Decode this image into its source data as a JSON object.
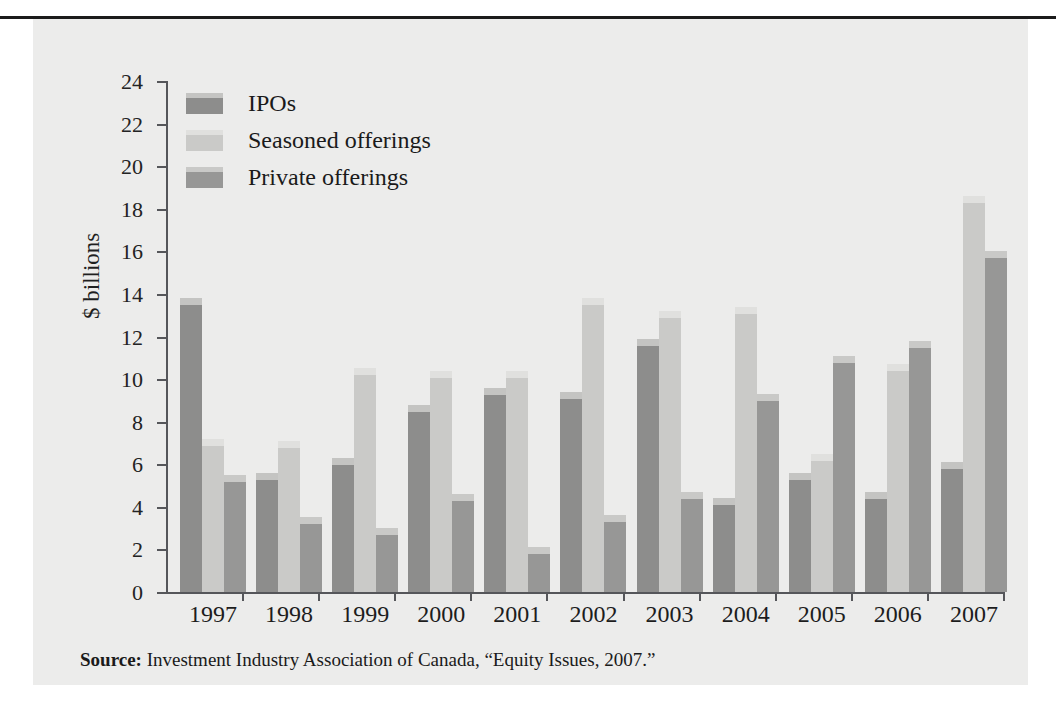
{
  "figure": {
    "y_axis_title": "$ billions",
    "source_prefix": "Source:",
    "source_text": " Investment Industry Association of Canada, “Equity Issues, 2007.”"
  },
  "colors": {
    "panel_background": "#ececeb",
    "axis": "#55565a",
    "top_rule": "#1b1b1b",
    "ipos": "#8d8d8c",
    "ipos_cap": "#c4c4c2",
    "seasoned": "#cacac8",
    "seasoned_cap": "#e0e0de",
    "private": "#979796",
    "private_cap": "#c9c9c7"
  },
  "chart_data": {
    "type": "bar",
    "title": "",
    "xlabel": "",
    "ylabel": "$ billions",
    "ylim": [
      0,
      24
    ],
    "yticks": [
      0,
      2,
      4,
      6,
      8,
      10,
      12,
      14,
      16,
      18,
      20,
      22,
      24
    ],
    "ytick_labels": [
      "0",
      "2",
      "4",
      "6",
      "8",
      "10",
      "12",
      "14",
      "16",
      "18",
      "20",
      "22",
      "24"
    ],
    "grid": false,
    "legend_position": "upper-left",
    "categories": [
      "1997",
      "1998",
      "1999",
      "2000",
      "2001",
      "2002",
      "2003",
      "2004",
      "2005",
      "2006",
      "2007"
    ],
    "series": [
      {
        "name": "IPOs",
        "color": "#8d8d8c",
        "values": [
          13.8,
          5.6,
          6.3,
          8.8,
          9.6,
          9.4,
          11.9,
          4.4,
          5.6,
          4.7,
          6.1
        ]
      },
      {
        "name": "Seasoned offerings",
        "color": "#cacac8",
        "values": [
          7.2,
          7.1,
          10.5,
          10.4,
          10.4,
          13.8,
          13.2,
          13.4,
          6.5,
          10.7,
          18.6
        ]
      },
      {
        "name": "Private offerings",
        "color": "#979796",
        "values": [
          5.5,
          3.5,
          3.0,
          4.6,
          2.1,
          3.6,
          4.7,
          9.3,
          11.1,
          11.8,
          16.0
        ]
      }
    ]
  }
}
